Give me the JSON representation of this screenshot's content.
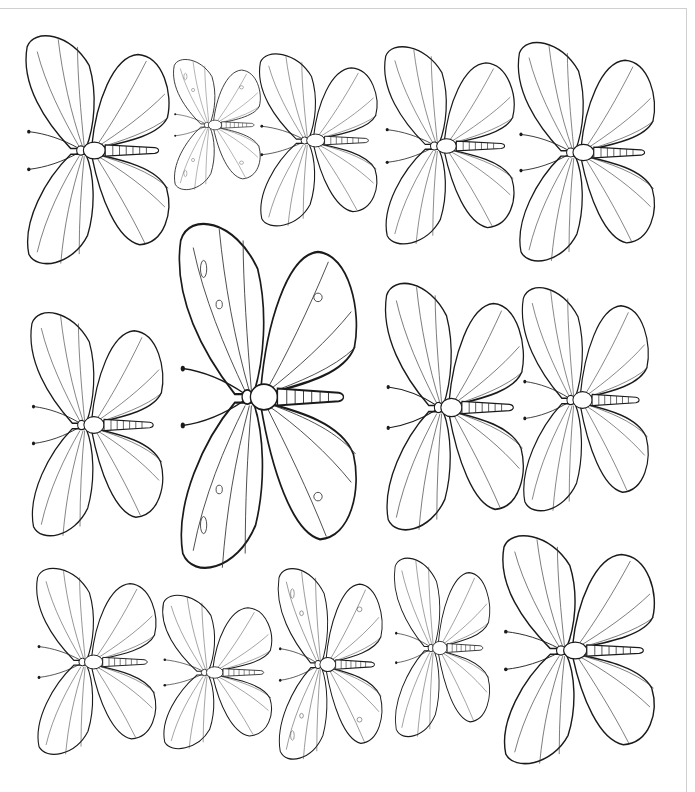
{
  "page": {
    "type": "coloring-page",
    "background": "#ffffff",
    "line_color": "#1a1a1a"
  },
  "butterflies": [
    {
      "id": 1,
      "x": 12,
      "y": 28,
      "w": 168,
      "h": 245,
      "style": "striped"
    },
    {
      "id": 2,
      "x": 165,
      "y": 55,
      "w": 102,
      "h": 140,
      "style": "spotted"
    },
    {
      "id": 3,
      "x": 248,
      "y": 48,
      "w": 138,
      "h": 185,
      "style": "fine-veined"
    },
    {
      "id": 4,
      "x": 372,
      "y": 40,
      "w": 152,
      "h": 212,
      "style": "striped"
    },
    {
      "id": 5,
      "x": 505,
      "y": 35,
      "w": 160,
      "h": 235,
      "style": "striped"
    },
    {
      "id": 6,
      "x": 18,
      "y": 305,
      "w": 155,
      "h": 240,
      "style": "striped"
    },
    {
      "id": 7,
      "x": 162,
      "y": 212,
      "w": 208,
      "h": 370,
      "style": "spotted"
    },
    {
      "id": 8,
      "x": 372,
      "y": 275,
      "w": 162,
      "h": 265,
      "style": "striped"
    },
    {
      "id": 9,
      "x": 510,
      "y": 280,
      "w": 148,
      "h": 240,
      "style": "striped"
    },
    {
      "id": 10,
      "x": 25,
      "y": 562,
      "w": 140,
      "h": 200,
      "style": "striped"
    },
    {
      "id": 11,
      "x": 152,
      "y": 590,
      "w": 128,
      "h": 165,
      "style": "striped"
    },
    {
      "id": 12,
      "x": 268,
      "y": 562,
      "w": 122,
      "h": 205,
      "style": "spotted"
    },
    {
      "id": 13,
      "x": 385,
      "y": 552,
      "w": 112,
      "h": 192,
      "style": "striped"
    },
    {
      "id": 14,
      "x": 488,
      "y": 528,
      "w": 178,
      "h": 245,
      "style": "striped"
    }
  ]
}
